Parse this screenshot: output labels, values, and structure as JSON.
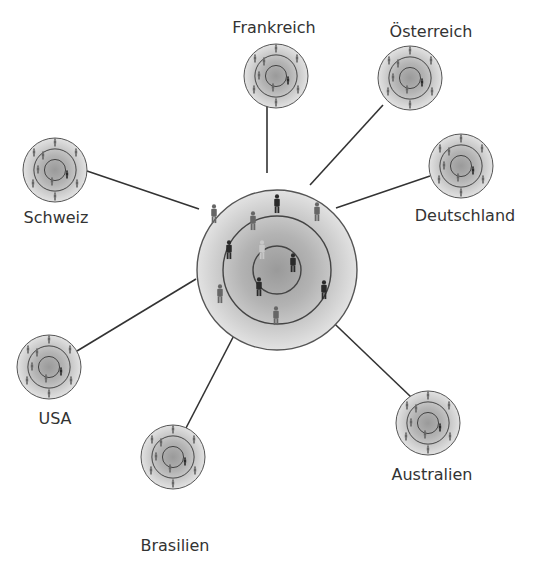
{
  "diagram": {
    "type": "hub-and-spoke network",
    "colors": {
      "background": "#ffffff",
      "line": "#333333",
      "ring": "#444444",
      "disc_light": "#dedede",
      "disc_mid": "#b5b5b5",
      "disc_dark": "#8f8f8f",
      "figure_dark": "#2a2a2a",
      "figure_mid": "#666666",
      "figure_light": "#c8c8c8",
      "label": "#333333"
    },
    "hub": {
      "name": "central-network",
      "cx": 277,
      "cy": 270,
      "r": 80,
      "rings": [
        80,
        54,
        24
      ],
      "figures": [
        {
          "x": 277,
          "y": 197,
          "tone": "dark"
        },
        {
          "x": 214,
          "y": 207,
          "tone": "mid"
        },
        {
          "x": 317,
          "y": 205,
          "tone": "mid"
        },
        {
          "x": 253,
          "y": 214,
          "tone": "mid"
        },
        {
          "x": 229,
          "y": 243,
          "tone": "dark"
        },
        {
          "x": 293,
          "y": 256,
          "tone": "dark"
        },
        {
          "x": 324,
          "y": 283,
          "tone": "dark"
        },
        {
          "x": 259,
          "y": 280,
          "tone": "dark"
        },
        {
          "x": 220,
          "y": 287,
          "tone": "mid"
        },
        {
          "x": 276,
          "y": 309,
          "tone": "mid"
        },
        {
          "x": 262,
          "y": 243,
          "tone": "light"
        }
      ]
    },
    "nodes": [
      {
        "id": "frankreich",
        "label": "Frankreich",
        "cx": 276,
        "cy": 76,
        "r": 32,
        "label_x": 274,
        "label_y": 19,
        "line": [
          267,
          105,
          267,
          173
        ]
      },
      {
        "id": "oesterreich",
        "label": "Österreich",
        "cx": 410,
        "cy": 78,
        "r": 32,
        "label_x": 431,
        "label_y": 23,
        "line": [
          383,
          105,
          310,
          185
        ]
      },
      {
        "id": "deutschland",
        "label": "Deutschland",
        "cx": 461,
        "cy": 166,
        "r": 32,
        "label_x": 465,
        "label_y": 207,
        "line": [
          430,
          176,
          336,
          208
        ]
      },
      {
        "id": "schweiz",
        "label": "Schweiz",
        "cx": 55,
        "cy": 170,
        "r": 32,
        "label_x": 56,
        "label_y": 209,
        "line": [
          87,
          171,
          199,
          209
        ]
      },
      {
        "id": "usa",
        "label": "USA",
        "cx": 49,
        "cy": 367,
        "r": 32,
        "label_x": 55,
        "label_y": 410,
        "line": [
          77,
          351,
          196,
          279
        ]
      },
      {
        "id": "brasilien",
        "label": "Brasilien",
        "cx": 173,
        "cy": 457,
        "r": 32,
        "label_x": 175,
        "label_y": 537,
        "line": [
          186,
          428,
          243,
          318
        ]
      },
      {
        "id": "australien",
        "label": "Australien",
        "cx": 428,
        "cy": 423,
        "r": 32,
        "label_x": 432,
        "label_y": 466,
        "line": [
          411,
          397,
          316,
          306
        ]
      }
    ]
  }
}
